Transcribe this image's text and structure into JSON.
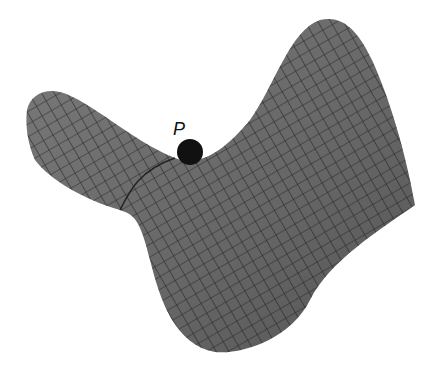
{
  "figure": {
    "point_label": "P",
    "colors": {
      "surface": "#6a6a6a",
      "grid": "#1e1e1e",
      "ball": "#111111",
      "background": "#ffffff"
    }
  }
}
